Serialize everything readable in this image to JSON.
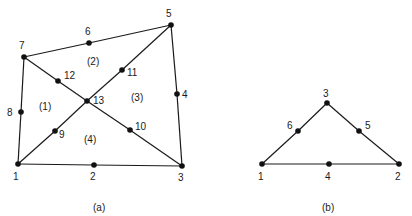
{
  "diagram_a": {
    "caption": "(a)",
    "nodes": [
      {
        "id": "1",
        "x": 18,
        "y": 164,
        "lx": 13,
        "ly": 180
      },
      {
        "id": "2",
        "x": 94,
        "y": 165,
        "lx": 90,
        "ly": 180
      },
      {
        "id": "3",
        "x": 182,
        "y": 166,
        "lx": 178,
        "ly": 181
      },
      {
        "id": "4",
        "x": 177,
        "y": 94,
        "lx": 182,
        "ly": 98
      },
      {
        "id": "5",
        "x": 171,
        "y": 25,
        "lx": 166,
        "ly": 17
      },
      {
        "id": "6",
        "x": 89,
        "y": 43,
        "lx": 85,
        "ly": 35
      },
      {
        "id": "7",
        "x": 24,
        "y": 57,
        "lx": 19,
        "ly": 49
      },
      {
        "id": "8",
        "x": 21,
        "y": 112,
        "lx": 7,
        "ly": 116
      },
      {
        "id": "9",
        "x": 55,
        "y": 131,
        "lx": 59,
        "ly": 138
      },
      {
        "id": "10",
        "x": 130,
        "y": 130,
        "lx": 135,
        "ly": 130
      },
      {
        "id": "11",
        "x": 122,
        "y": 70,
        "lx": 127,
        "ly": 76
      },
      {
        "id": "12",
        "x": 58,
        "y": 81,
        "lx": 64,
        "ly": 79
      },
      {
        "id": "13",
        "x": 87,
        "y": 101,
        "lx": 93,
        "ly": 104
      }
    ],
    "edges": [
      [
        "1",
        "2"
      ],
      [
        "2",
        "3"
      ],
      [
        "3",
        "4"
      ],
      [
        "4",
        "5"
      ],
      [
        "5",
        "6"
      ],
      [
        "6",
        "7"
      ],
      [
        "7",
        "8"
      ],
      [
        "8",
        "1"
      ],
      [
        "1",
        "9"
      ],
      [
        "9",
        "13"
      ],
      [
        "13",
        "11"
      ],
      [
        "11",
        "5"
      ],
      [
        "7",
        "12"
      ],
      [
        "12",
        "13"
      ],
      [
        "13",
        "10"
      ],
      [
        "10",
        "3"
      ]
    ],
    "element_labels": [
      {
        "text": "(1)",
        "x": 39,
        "y": 110
      },
      {
        "text": "(2)",
        "x": 87,
        "y": 65
      },
      {
        "text": "(3)",
        "x": 131,
        "y": 101
      },
      {
        "text": "(4)",
        "x": 84,
        "y": 143
      }
    ],
    "caption_pos": {
      "x": 93,
      "y": 211
    }
  },
  "diagram_b": {
    "caption": "(b)",
    "nodes": [
      {
        "id": "1",
        "x": 262,
        "y": 164,
        "lx": 258,
        "ly": 180
      },
      {
        "id": "2",
        "x": 399,
        "y": 164,
        "lx": 395,
        "ly": 180
      },
      {
        "id": "3",
        "x": 327,
        "y": 103,
        "lx": 323,
        "ly": 97
      },
      {
        "id": "4",
        "x": 329,
        "y": 164,
        "lx": 325,
        "ly": 180
      },
      {
        "id": "5",
        "x": 359,
        "y": 131,
        "lx": 365,
        "ly": 129
      },
      {
        "id": "6",
        "x": 298,
        "y": 131,
        "lx": 287,
        "ly": 129
      }
    ],
    "edges": [
      [
        "1",
        "4"
      ],
      [
        "4",
        "2"
      ],
      [
        "2",
        "5"
      ],
      [
        "5",
        "3"
      ],
      [
        "3",
        "6"
      ],
      [
        "6",
        "1"
      ]
    ],
    "caption_pos": {
      "x": 322,
      "y": 211
    }
  }
}
